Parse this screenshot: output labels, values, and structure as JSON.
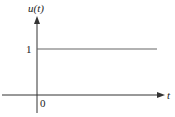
{
  "diagram": {
    "y_axis_label": "u(t)",
    "x_axis_label": "t",
    "origin_label": "0",
    "level_label": "1",
    "function": {
      "name": "u(t)",
      "segments": [
        {
          "t_from": "-inf",
          "t_to": 0,
          "value": 0
        },
        {
          "t_from": 0,
          "t_to": "inf",
          "value": 1
        }
      ]
    },
    "colors": {
      "axis": "#333333",
      "signal": "#555555"
    }
  }
}
